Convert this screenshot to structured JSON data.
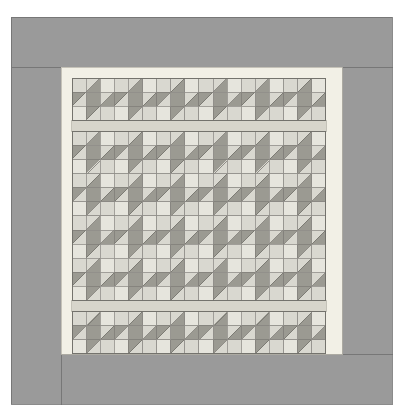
{
  "document": {
    "kind": "quilt-pattern-diagram",
    "title": "Star Block Quilt Layout Diagram",
    "canvas": {
      "width": 400,
      "height": 420,
      "background": "#ffffff"
    }
  },
  "palette": {
    "background": "#ffffff",
    "outer_border": "#9a9a9a",
    "outer_border_stroke": "#6e6e6e",
    "inner_border": "#f2f0e6",
    "inner_border_stroke": "#b9b7ad",
    "sashing": "#d7d5cb",
    "sashing_stroke": "#b0aea4",
    "patch_light": "#d9d8d0",
    "patch_light_alt": "#e6e5dd",
    "patch_mid": "#b8b7ae",
    "patch_dark": "#9b9a92",
    "patch_stroke": "#6f6e68",
    "grid_line": "#8f8e88"
  },
  "layout": {
    "outer_border": {
      "x": 11,
      "y": 17,
      "width": 381,
      "height": 387,
      "band": 50
    },
    "inner_border": {
      "x": 61,
      "y": 67,
      "width": 281,
      "height": 287,
      "band": 11
    },
    "grid": {
      "x": 72,
      "y": 78,
      "cell": 14.1,
      "cols": 18,
      "rows": 18,
      "block_size": 3,
      "blocks_across": 6,
      "blocks_down": 6
    },
    "sashing_strips": [
      {
        "orientation": "horizontal",
        "after_row": 3,
        "thickness": 11
      },
      {
        "orientation": "horizontal",
        "after_row": 15,
        "thickness": 11
      }
    ]
  },
  "block": {
    "name": "friendship-star",
    "grid": "3x3",
    "description": "Nine-patch star: four half-square-triangle star points around a dark center square with light corners.",
    "cells": [
      {
        "r": 0,
        "c": 0,
        "type": "plain",
        "fill": "patch_light"
      },
      {
        "r": 0,
        "c": 1,
        "type": "hst",
        "corner": "br",
        "fill_a": "patch_light",
        "fill_b": "patch_dark"
      },
      {
        "r": 0,
        "c": 2,
        "type": "plain",
        "fill": "patch_light_alt"
      },
      {
        "r": 1,
        "c": 0,
        "type": "hst",
        "corner": "tl",
        "fill_a": "patch_dark",
        "fill_b": "patch_light"
      },
      {
        "r": 1,
        "c": 1,
        "type": "plain",
        "fill": "patch_dark"
      },
      {
        "r": 1,
        "c": 2,
        "type": "hst",
        "corner": "br",
        "fill_a": "patch_light",
        "fill_b": "patch_dark"
      },
      {
        "r": 2,
        "c": 0,
        "type": "plain",
        "fill": "patch_light_alt"
      },
      {
        "r": 2,
        "c": 1,
        "type": "hst",
        "corner": "tl",
        "fill_a": "patch_dark",
        "fill_b": "patch_light"
      },
      {
        "r": 2,
        "c": 2,
        "type": "plain",
        "fill": "patch_light"
      }
    ]
  },
  "sections": [
    {
      "name": "top-row",
      "block_rows": 1,
      "block_cols": 6
    },
    {
      "name": "center-field",
      "block_rows": 4,
      "block_cols": 6
    },
    {
      "name": "bottom-row",
      "block_rows": 1,
      "block_cols": 6
    }
  ],
  "counts": {
    "total_blocks": 36,
    "blocks_per_row": 6,
    "block_rows": 6,
    "patches_per_block": 9,
    "total_patches": 324
  }
}
